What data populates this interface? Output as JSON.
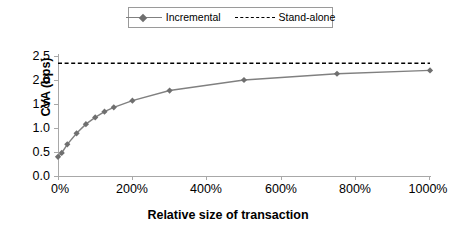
{
  "chart_data": {
    "type": "line",
    "title": "",
    "xlabel": "Relative size of transaction",
    "ylabel": "CVA (bps)",
    "xlim": [
      0,
      1000
    ],
    "ylim": [
      0.0,
      2.5
    ],
    "xticks": [
      "0%",
      "200%",
      "400%",
      "600%",
      "800%",
      "1000%"
    ],
    "xtick_values": [
      0,
      200,
      400,
      600,
      800,
      1000
    ],
    "yticks": [
      "0.0",
      "0.5",
      "1.0",
      "1.5",
      "2.0",
      "2.5"
    ],
    "ytick_values": [
      0.0,
      0.5,
      1.0,
      1.5,
      2.0,
      2.5
    ],
    "grid": false,
    "legend_position": "top-center",
    "series": [
      {
        "name": "Incremental",
        "marker": "diamond",
        "linestyle": "solid",
        "color": "#808080",
        "x": [
          0,
          10,
          25,
          50,
          75,
          100,
          125,
          150,
          200,
          300,
          500,
          750,
          1000
        ],
        "values": [
          0.4,
          0.48,
          0.66,
          0.89,
          1.08,
          1.22,
          1.34,
          1.43,
          1.57,
          1.78,
          2.0,
          2.13,
          2.2
        ]
      },
      {
        "name": "Stand-alone",
        "marker": "none",
        "linestyle": "dashed",
        "color": "#000000",
        "constant_value": 2.35,
        "x": [
          0,
          1000
        ],
        "values": [
          2.35,
          2.35
        ]
      }
    ]
  },
  "legend": {
    "items": [
      {
        "label": "Incremental"
      },
      {
        "label": "Stand-alone"
      }
    ]
  },
  "axes": {
    "y_title": "CVA (bps)",
    "x_title": "Relative size of transaction"
  }
}
